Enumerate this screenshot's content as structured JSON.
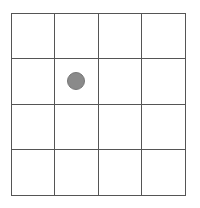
{
  "board": {
    "rows": 4,
    "cols": 4,
    "line_color": "#555555",
    "pieces": [
      {
        "row": 1,
        "col": 1,
        "color": "#8a8a8a",
        "shape": "circle"
      }
    ]
  }
}
